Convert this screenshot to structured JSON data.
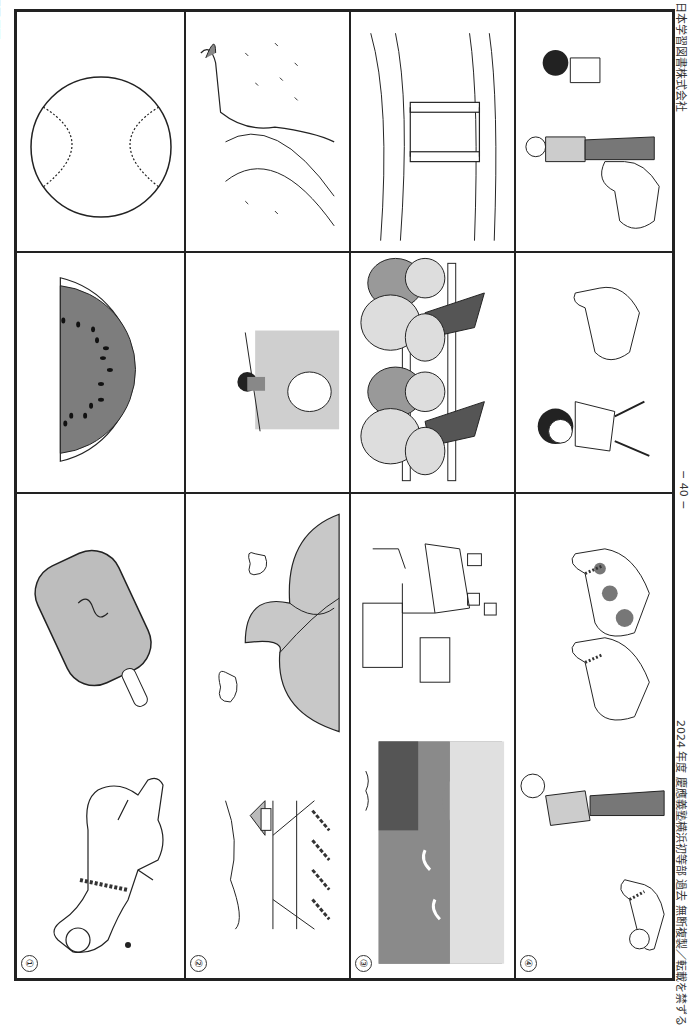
{
  "page": {
    "title": "問題16",
    "orientation": "rotated 90° clockwise",
    "page_number": "− 40 −",
    "footer_left": "2024 年度  慶應義塾横浜初等部  過去  無断複製／転載を禁ずる",
    "footer_right": "日本学習図書株式会社"
  },
  "rows": [
    {
      "number": "①",
      "cells": [
        {
          "label": "dog",
          "description": "Shiba dog with checkered collar"
        },
        {
          "label": "popsicle",
          "description": "Popsicle on a stick"
        },
        {
          "label": "watermelon",
          "description": "Watermelon slice with seeds"
        },
        {
          "label": "baseball",
          "description": "Baseball"
        }
      ]
    },
    {
      "number": "②",
      "cells": [
        {
          "label": "rice-field",
          "description": "Rice field with house and hills"
        },
        {
          "label": "mountains",
          "description": "Mountains with clouds"
        },
        {
          "label": "river-peach",
          "description": "Child by river with floating peach"
        },
        {
          "label": "river",
          "description": "River flowing from mountain with grass"
        }
      ]
    },
    {
      "number": "③",
      "cells": [
        {
          "label": "sea-rocks",
          "description": "Seashore with rocks and waves"
        },
        {
          "label": "room",
          "description": "Child's room with bed, desk and toys"
        },
        {
          "label": "trees-fence",
          "description": "Two trees with fence"
        },
        {
          "label": "bridge",
          "description": "Wooden bridge over river"
        }
      ]
    },
    {
      "number": "④",
      "cells": [
        {
          "label": "old-man-dog",
          "description": "Old man and dog"
        },
        {
          "label": "two-dogs",
          "description": "Two dogs, one spotted"
        },
        {
          "label": "boy-dog",
          "description": "Boy running with dog"
        },
        {
          "label": "boy-old-man-dog",
          "description": "Old man, dog and running boy"
        }
      ]
    }
  ],
  "colors": {
    "line": "#222222",
    "gray_dark": "#7a7a7a",
    "gray_mid": "#a8a8a8",
    "gray_light": "#d6d6d6"
  }
}
